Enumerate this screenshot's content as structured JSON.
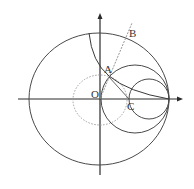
{
  "diagram": {
    "type": "geometry",
    "labels": {
      "A": "A",
      "B": "B",
      "C": "C",
      "O": "O"
    },
    "colors": {
      "stroke": "#3a3a3a",
      "dotted": "#9a9a9a",
      "dashed": "#888888",
      "background": "#ffffff"
    },
    "elements": {
      "x_axis": "horizontal axis with arrow pointing right",
      "y_axis": "vertical axis with arrow pointing up",
      "large_circle": "circle centered at O",
      "dotted_circle": "small dotted circle centered at O",
      "medium_circle": "circle tangent internally at right intersection",
      "small_circle": "smaller circle tangent at right intersection",
      "arc": "arc from top of large circle through A to right intersection",
      "ray_OB": "dashed ray from O through A to B",
      "segment_AC": "segment from A to C"
    }
  }
}
